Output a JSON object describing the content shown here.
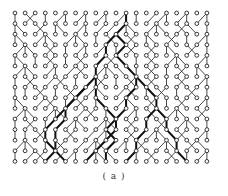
{
  "figure": {
    "caption": "( a )",
    "grid": {
      "cols": 20,
      "rows": 15,
      "x0": 15,
      "dx": 10.1,
      "y0": 13,
      "dy": 10.6,
      "node_radius": 1.9
    },
    "colors": {
      "node_stroke": "#222222",
      "edge": "#333333",
      "thick_edge": "#111111",
      "background": "#ffffff"
    },
    "parent_offsets": [
      [
        0,
        0,
        0,
        0,
        0,
        0,
        0,
        0,
        0,
        0,
        0,
        0,
        0,
        0,
        0,
        0,
        0,
        0,
        0,
        0
      ],
      [
        0,
        1,
        -1,
        0,
        1,
        0,
        1,
        0,
        1,
        0,
        1,
        0,
        0,
        1,
        1,
        0,
        1,
        0,
        1,
        0
      ],
      [
        0,
        -1,
        1,
        -1,
        0,
        -1,
        1,
        0,
        1,
        1,
        1,
        0,
        -1,
        1,
        0,
        -1,
        1,
        -1,
        -1,
        0
      ],
      [
        0,
        -1,
        1,
        0,
        -1,
        1,
        0,
        -1,
        0,
        1,
        -1,
        1,
        -1,
        0,
        -1,
        1,
        -1,
        0,
        1,
        0
      ],
      [
        1,
        0,
        -1,
        1,
        -1,
        0,
        1,
        0,
        1,
        0,
        0,
        1,
        -1,
        1,
        -1,
        0,
        -1,
        1,
        -1,
        0
      ],
      [
        0,
        -1,
        0,
        1,
        -1,
        0,
        1,
        -1,
        1,
        1,
        -1,
        -1,
        0,
        1,
        -1,
        1,
        0,
        -1,
        1,
        0
      ],
      [
        1,
        0,
        -1,
        1,
        0,
        1,
        1,
        -1,
        1,
        0,
        -1,
        -1,
        0,
        1,
        -1,
        0,
        1,
        -1,
        0,
        -1
      ],
      [
        0,
        1,
        -1,
        1,
        1,
        -1,
        0,
        1,
        1,
        -1,
        0,
        1,
        -1,
        1,
        -1,
        0,
        1,
        -1,
        1,
        0
      ],
      [
        -1,
        0,
        1,
        -1,
        0,
        1,
        -1,
        1,
        0,
        -1,
        1,
        1,
        -1,
        0,
        1,
        -1,
        0,
        1,
        -1,
        0
      ],
      [
        0,
        -1,
        1,
        1,
        -1,
        0,
        1,
        -1,
        0,
        -1,
        1,
        0,
        -1,
        1,
        -1,
        0,
        1,
        -1,
        1,
        0
      ],
      [
        1,
        0,
        -1,
        1,
        0,
        -1,
        1,
        1,
        -1,
        0,
        -1,
        1,
        0,
        1,
        -1,
        1,
        0,
        -1,
        1,
        -1
      ],
      [
        0,
        1,
        -1,
        0,
        1,
        1,
        0,
        -1,
        1,
        0,
        -1,
        1,
        -1,
        0,
        1,
        -1,
        1,
        0,
        -1,
        0
      ],
      [
        -1,
        0,
        1,
        -1,
        0,
        1,
        -1,
        1,
        1,
        0,
        -1,
        1,
        -1,
        1,
        0,
        -1,
        1,
        -1,
        1,
        0
      ],
      [
        1,
        0,
        -1,
        0,
        1,
        -1,
        1,
        1,
        0,
        -1,
        1,
        0,
        1,
        -1,
        1,
        0,
        -1,
        1,
        -1,
        -1
      ],
      [
        0,
        1,
        1,
        -1,
        1,
        1,
        0,
        1,
        0,
        -1,
        -1,
        1,
        0,
        1,
        -1,
        1,
        -1,
        0,
        1,
        0
      ]
    ],
    "thick_paths": [
      [
        [
          11,
          0
        ],
        [
          11,
          1
        ],
        [
          10,
          2
        ],
        [
          9,
          3
        ],
        [
          9,
          4
        ],
        [
          8,
          5
        ],
        [
          8,
          6
        ],
        [
          7,
          7
        ],
        [
          6,
          8
        ],
        [
          5,
          9
        ],
        [
          4,
          10
        ],
        [
          3,
          11
        ],
        [
          3,
          12
        ],
        [
          4,
          13
        ],
        [
          3,
          14
        ]
      ],
      [
        [
          10,
          2
        ],
        [
          11,
          3
        ],
        [
          10,
          4
        ],
        [
          11,
          5
        ],
        [
          12,
          6
        ],
        [
          12,
          7
        ],
        [
          11,
          8
        ],
        [
          11,
          9
        ],
        [
          10,
          10
        ],
        [
          9,
          11
        ],
        [
          10,
          12
        ],
        [
          9,
          13
        ],
        [
          9,
          14
        ]
      ],
      [
        [
          8,
          6
        ],
        [
          8,
          7
        ],
        [
          8,
          8
        ],
        [
          9,
          9
        ],
        [
          10,
          10
        ],
        [
          10,
          11
        ],
        [
          9,
          12
        ],
        [
          8,
          13
        ],
        [
          7,
          14
        ]
      ],
      [
        [
          12,
          6
        ],
        [
          13,
          7
        ],
        [
          14,
          8
        ],
        [
          14,
          9
        ],
        [
          13,
          10
        ],
        [
          13,
          11
        ],
        [
          12,
          12
        ],
        [
          12,
          13
        ],
        [
          11,
          14
        ]
      ],
      [
        [
          7,
          7
        ],
        [
          6,
          8
        ],
        [
          5,
          9
        ],
        [
          5,
          10
        ],
        [
          4,
          11
        ],
        [
          4,
          12
        ],
        [
          4,
          13
        ],
        [
          5,
          14
        ]
      ],
      [
        [
          14,
          9
        ],
        [
          15,
          10
        ],
        [
          15,
          11
        ],
        [
          16,
          12
        ],
        [
          16,
          13
        ],
        [
          17,
          14
        ]
      ]
    ]
  }
}
